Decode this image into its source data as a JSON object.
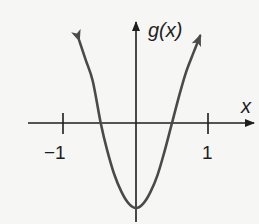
{
  "chart_data": {
    "type": "line",
    "title": "",
    "xlabel": "x",
    "ylabel": "g(x)",
    "x_ticks": [
      -1,
      1
    ],
    "x_tick_labels": [
      "−1",
      "1"
    ],
    "y_ticks": [],
    "grid": false,
    "legend": null,
    "series": [
      {
        "name": "g(x)",
        "description": "U-shaped curve opening upward, arrows on both ends",
        "x": [
          -0.79,
          -0.7,
          -0.6,
          -0.49,
          -0.4,
          -0.3,
          -0.2,
          -0.1,
          0,
          0.1,
          0.2,
          0.3,
          0.4,
          0.5,
          0.6,
          0.7,
          0.8,
          0.89
        ],
        "y": [
          1.15,
          0.88,
          0.58,
          0.0,
          -0.38,
          -0.72,
          -0.96,
          -1.12,
          -1.18,
          -1.12,
          -0.96,
          -0.72,
          -0.38,
          0.0,
          0.38,
          0.72,
          0.98,
          1.21
        ]
      }
    ],
    "x_intercepts": [
      -0.5,
      0.5
    ],
    "vertex": [
      0,
      -1.18
    ],
    "xlim": [
      -1.5,
      1.65
    ],
    "ylim": [
      -1.4,
      1.4
    ]
  },
  "labels": {
    "y_axis": "g(x)",
    "x_axis": "x",
    "tick_neg1": "−1",
    "tick_1": "1"
  },
  "colors": {
    "background": "#f6f6f5",
    "axis": "#1e1e1e",
    "curve": "#4a4a4a"
  }
}
